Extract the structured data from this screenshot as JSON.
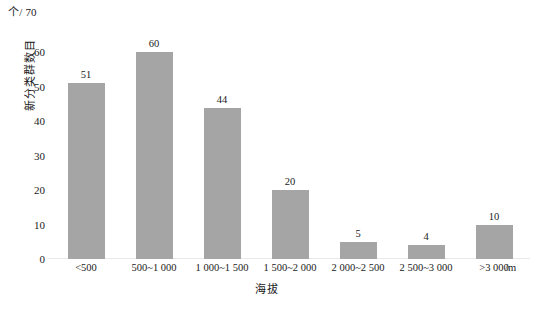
{
  "chart_data": {
    "type": "bar",
    "title": "",
    "categories": [
      "<500",
      "500~1 000",
      "1 000~1 500",
      "1 500~2 000",
      "2 000~2 500",
      "2 500~3 000",
      ">3 000"
    ],
    "values": [
      51,
      60,
      44,
      20,
      5,
      4,
      10
    ],
    "xlabel": "海拔",
    "ylabel": "新分类群数目",
    "x_unit": "/m",
    "y_unit": "个",
    "ylim": [
      0,
      70
    ],
    "yticks": [
      0,
      10,
      20,
      30,
      40,
      50,
      60,
      70
    ],
    "ytick_labels": [
      "0",
      "10",
      "20",
      "30",
      "40",
      "50",
      "60",
      "70"
    ],
    "grid": false,
    "legend": null,
    "bar_color": "#a5a5a5",
    "background_color": "#ffffff",
    "data_labels": [
      "51",
      "60",
      "44",
      "20",
      "5",
      "4",
      "10"
    ],
    "y_unit_label": "个/ 70"
  }
}
